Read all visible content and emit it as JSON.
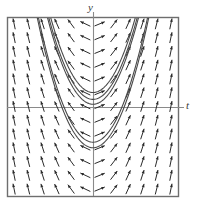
{
  "figure": {
    "type": "direction-field-with-solution-curves",
    "axis_labels": {
      "vertical": "y",
      "horizontal": "t"
    },
    "colors": {
      "frame": "#6e6e6e",
      "axis": "#8a8a8a",
      "arrow": "#2a2a2a",
      "curve": "#4a4a4a",
      "background": "#ffffff",
      "label": "#3b3b3b"
    }
  },
  "chart_data": {
    "type": "line",
    "title": "",
    "xlabel": "t",
    "ylabel": "y",
    "grid": false,
    "legend": null,
    "xlim": [
      -6,
      6
    ],
    "ylim": [
      -6,
      7
    ],
    "frame_px": {
      "left": 7,
      "top": 17,
      "right": 178,
      "bottom": 196
    },
    "origin_px": {
      "x": 93,
      "y": 107
    },
    "scale_px_per_unit": {
      "x": 14.3,
      "y": 13.8
    },
    "direction_field": {
      "description": "slope field of dy/dt with arrows on a 12 by 13 grid",
      "grid_cols": 12,
      "grid_rows": 13,
      "arrow_length_px": 11,
      "slope_rule": "arrows point down-left on the far left, rotate through horizontal near the y-axis, and point up-right becoming vertical on the far right"
    },
    "series": [
      {
        "name": "solution-curve-1",
        "vertex": [
          0,
          -2.95
        ],
        "a": 0.62,
        "description": "lowest parabola, vertex below the t-axis"
      },
      {
        "name": "solution-curve-2",
        "vertex": [
          0,
          -2.55
        ],
        "a": 0.62,
        "description": "second parabola just above curve 1"
      },
      {
        "name": "solution-curve-3",
        "vertex": [
          0,
          0.2
        ],
        "a": 0.62,
        "description": "parabola with vertex just above the t-axis"
      },
      {
        "name": "solution-curve-4",
        "vertex": [
          0,
          0.55
        ],
        "a": 0.62,
        "description": "parabola nested above curve 3"
      },
      {
        "name": "solution-curve-5",
        "vertex": [
          0,
          1.05
        ],
        "a": 0.62,
        "description": "upper parabola"
      }
    ]
  }
}
